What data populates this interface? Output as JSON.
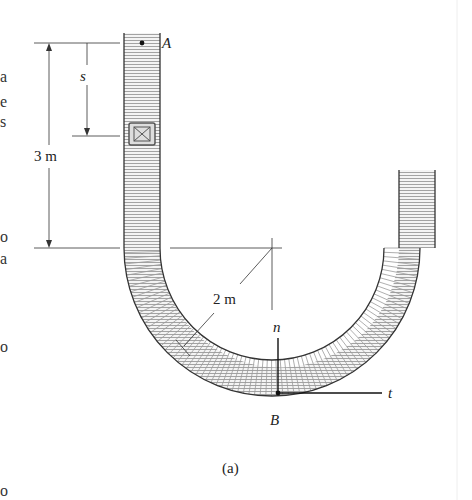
{
  "figure": {
    "caption": "(a)",
    "labels": {
      "point_a": "A",
      "point_b": "B",
      "distance_s": "s",
      "height_dim": "3 m",
      "radius_dim": "2 m",
      "normal_axis": "n",
      "tangent_axis": "t"
    },
    "clipped_left_text": [
      "a",
      "e",
      "s",
      "o",
      "a",
      "o",
      "o"
    ]
  }
}
